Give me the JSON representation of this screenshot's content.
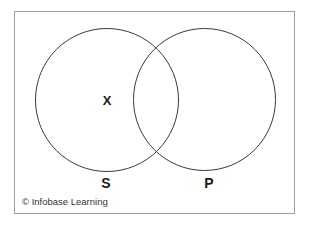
{
  "diagram": {
    "type": "venn",
    "left_circle": {
      "label": "S",
      "mark": "X"
    },
    "right_circle": {
      "label": "P"
    },
    "intersection": {
      "mark": ""
    },
    "colors": {
      "circle_stroke": "#3a3a3a",
      "frame_border": "#9e9e9e",
      "background": "#ffffff",
      "text": "#1c1c1c"
    }
  },
  "footer": {
    "copyright": "© Infobase Learning"
  }
}
